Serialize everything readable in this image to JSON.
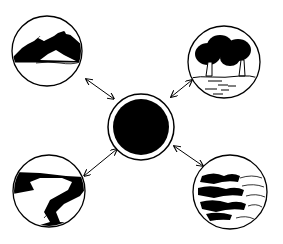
{
  "diagram": {
    "type": "hub-and-spoke",
    "background": "#ffffff",
    "ink_color": "#000000",
    "center": {
      "label": "",
      "semantic": "central black circle (hub)",
      "cx": 141,
      "cy": 127,
      "r_outer": 33,
      "r_inner": 28
    },
    "nodes": [
      {
        "id": "mountains",
        "semantic": "mountain landscape",
        "cx": 47,
        "cy": 51,
        "r": 35
      },
      {
        "id": "forest",
        "semantic": "trees / forest over land",
        "cx": 224,
        "cy": 62,
        "r": 36
      },
      {
        "id": "river",
        "semantic": "river winding through land",
        "cx": 49,
        "cy": 191,
        "r": 36
      },
      {
        "id": "ocean",
        "semantic": "ocean / water waves",
        "cx": 230,
        "cy": 192,
        "r": 37
      }
    ],
    "connections": [
      {
        "from": "center",
        "to": "mountains",
        "arrow": "double-headed"
      },
      {
        "from": "center",
        "to": "forest",
        "arrow": "double-headed"
      },
      {
        "from": "center",
        "to": "river",
        "arrow": "double-headed"
      },
      {
        "from": "center",
        "to": "ocean",
        "arrow": "double-headed"
      }
    ]
  }
}
